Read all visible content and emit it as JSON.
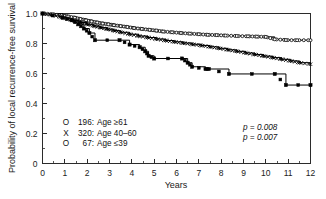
{
  "figure": {
    "name": "kaplan-meier-local-recurrence-free-survival",
    "background": "#ffffff",
    "line_color": "#000000"
  },
  "chart_data": {
    "type": "line",
    "title": "",
    "subtitle": "",
    "xlabel": "Years",
    "ylabel": "Probability of local recurrence-free survival",
    "xlim": [
      0,
      12
    ],
    "ylim": [
      0,
      1.0
    ],
    "xticks": [
      0,
      1,
      2,
      3,
      4,
      5,
      6,
      7,
      8,
      9,
      10,
      11,
      12
    ],
    "xtick_labels": [
      "0",
      "1",
      "2",
      "3",
      "4",
      "5",
      "6",
      "7",
      "8",
      "9",
      "10",
      "11",
      "12"
    ],
    "xminor_step": 0.5,
    "yticks": [
      0,
      0.2,
      0.4,
      0.6,
      0.8,
      1.0
    ],
    "ytick_labels": [
      "0",
      "0.2",
      "0.4",
      "0.6",
      "0.8",
      "1.0"
    ],
    "yminor_step": 0.1,
    "grid": false,
    "legend_position": "lower-left-inside",
    "curve_style": "step-post",
    "series": [
      {
        "name": "Age >=61",
        "marker": "open-circle",
        "n": 196,
        "x": [
          0.0,
          0.45,
          0.85,
          1.15,
          1.45,
          1.7,
          1.95,
          2.2,
          2.45,
          2.7,
          2.95,
          3.2,
          3.5,
          3.8,
          4.1,
          4.45,
          4.8,
          5.1,
          5.4,
          5.8,
          6.2,
          6.6,
          7.0,
          7.4,
          7.8,
          8.2,
          8.7,
          9.2,
          9.6,
          10.0,
          10.4,
          10.9,
          11.4,
          12.0
        ],
        "y": [
          1.0,
          0.995,
          0.988,
          0.98,
          0.972,
          0.963,
          0.955,
          0.947,
          0.94,
          0.933,
          0.928,
          0.922,
          0.916,
          0.91,
          0.903,
          0.897,
          0.891,
          0.886,
          0.88,
          0.875,
          0.87,
          0.866,
          0.862,
          0.858,
          0.856,
          0.853,
          0.85,
          0.848,
          0.846,
          0.844,
          0.828,
          0.823,
          0.822,
          0.822
        ]
      },
      {
        "name": "Age 40-60",
        "marker": "x-cross",
        "n": 320,
        "x": [
          0.0,
          0.4,
          0.8,
          1.1,
          1.4,
          1.7,
          2.0,
          2.3,
          2.6,
          2.9,
          3.2,
          3.5,
          3.9,
          4.3,
          4.7,
          5.1,
          5.5,
          5.9,
          6.3,
          6.7,
          7.1,
          7.5,
          7.9,
          8.3,
          8.7,
          9.1,
          9.5,
          9.9,
          10.3,
          10.7,
          11.1,
          11.5,
          12.0
        ],
        "y": [
          1.0,
          0.99,
          0.978,
          0.965,
          0.952,
          0.94,
          0.928,
          0.917,
          0.906,
          0.896,
          0.886,
          0.875,
          0.862,
          0.85,
          0.84,
          0.83,
          0.82,
          0.811,
          0.803,
          0.795,
          0.787,
          0.778,
          0.768,
          0.758,
          0.748,
          0.737,
          0.727,
          0.716,
          0.706,
          0.695,
          0.684,
          0.672,
          0.662
        ]
      },
      {
        "name": "Age <=39",
        "marker": "filled-square",
        "n": 67,
        "x": [
          0.0,
          0.9,
          1.3,
          1.6,
          1.85,
          2.1,
          2.35,
          3.45,
          3.9,
          4.35,
          4.6,
          4.75,
          5.0,
          6.25,
          6.5,
          6.7,
          7.3,
          7.45,
          8.35,
          10.4,
          10.9,
          12.0
        ],
        "y": [
          1.0,
          0.972,
          0.955,
          0.928,
          0.9,
          0.87,
          0.822,
          0.822,
          0.793,
          0.775,
          0.748,
          0.718,
          0.7,
          0.7,
          0.672,
          0.645,
          0.63,
          0.63,
          0.597,
          0.597,
          0.523,
          0.523
        ]
      }
    ],
    "annotations": [
      {
        "text": "p = 0.008",
        "x": 9.1,
        "y": 0.27
      },
      {
        "text": "p = 0.007",
        "x": 9.1,
        "y": 0.205
      }
    ]
  },
  "legend": {
    "entries": [
      {
        "symbol": "O",
        "count": "196",
        "label": "Age ≥61",
        "text": "196: Age ≥61"
      },
      {
        "symbol": "X",
        "count": "320",
        "label": "Age 40–60",
        "text": "320: Age 40–60"
      },
      {
        "symbol": "O",
        "count": "67",
        "label": "Age ≤39",
        "text": "67: Age ≤39"
      }
    ]
  },
  "pvalues": {
    "first": "p = 0.008",
    "second": "p = 0.007"
  },
  "axes": {
    "x_title": "Years",
    "y_title": "Probability of local recurrence-free survival"
  }
}
